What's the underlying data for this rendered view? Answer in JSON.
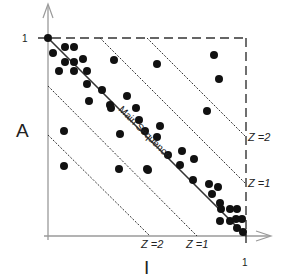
{
  "figure": {
    "y_axis_label": "A",
    "x_axis_label": "I",
    "y_tick_top": "1",
    "x_tick_right": "1",
    "main_sequence_label": "Main Sequence",
    "zone_labels_right": [
      {
        "label": "Z =2",
        "x": 248,
        "y": 141
      },
      {
        "label": "Z =1",
        "x": 248,
        "y": 187
      }
    ],
    "zone_labels_bottom": [
      {
        "label": "Z =2",
        "x": 141,
        "y": 248
      },
      {
        "label": "Z =1",
        "x": 186,
        "y": 248
      }
    ],
    "colors": {
      "axis": "#9a9a9a",
      "line": "#333333",
      "dot": "#111111",
      "text": "#222222"
    },
    "plot_box": {
      "x0": 48,
      "y0": 38,
      "x1": 246,
      "y1": 236
    },
    "main_sequence": {
      "x1": 48,
      "y1": 38,
      "x2": 246,
      "y2": 236
    },
    "zone_lines": [
      {
        "name": "upper-z2",
        "x1": 147,
        "y1": 38,
        "x2": 246,
        "y2": 137
      },
      {
        "name": "upper-z1",
        "x1": 100,
        "y1": 38,
        "x2": 246,
        "y2": 184
      },
      {
        "name": "lower-z1",
        "x1": 48,
        "y1": 86,
        "x2": 197,
        "y2": 236
      },
      {
        "name": "lower-z2",
        "x1": 48,
        "y1": 135,
        "x2": 150,
        "y2": 236
      }
    ],
    "points": [
      [
        48,
        38
      ],
      [
        65,
        47
      ],
      [
        74,
        47
      ],
      [
        53,
        53
      ],
      [
        65,
        62
      ],
      [
        74,
        62
      ],
      [
        83,
        59
      ],
      [
        59,
        71
      ],
      [
        74,
        71
      ],
      [
        87,
        71
      ],
      [
        87,
        84
      ],
      [
        102,
        90
      ],
      [
        114,
        60
      ],
      [
        157,
        64
      ],
      [
        214,
        55
      ],
      [
        219,
        79
      ],
      [
        89,
        101
      ],
      [
        110,
        105
      ],
      [
        127,
        96
      ],
      [
        111,
        108
      ],
      [
        136,
        108
      ],
      [
        139,
        120
      ],
      [
        160,
        126
      ],
      [
        145,
        131
      ],
      [
        157,
        137
      ],
      [
        120,
        134
      ],
      [
        207,
        111
      ],
      [
        64,
        131
      ],
      [
        64,
        166
      ],
      [
        119,
        169
      ],
      [
        147,
        169
      ],
      [
        148,
        170
      ],
      [
        168,
        155
      ],
      [
        182,
        151
      ],
      [
        180,
        165
      ],
      [
        193,
        180
      ],
      [
        194,
        159
      ],
      [
        209,
        184
      ],
      [
        212,
        194
      ],
      [
        218,
        187
      ],
      [
        220,
        203
      ],
      [
        221,
        209
      ],
      [
        230,
        209
      ],
      [
        237,
        209
      ],
      [
        220,
        221
      ],
      [
        230,
        221
      ],
      [
        236,
        219
      ],
      [
        242,
        219
      ],
      [
        237,
        228
      ],
      [
        243,
        232
      ]
    ]
  }
}
